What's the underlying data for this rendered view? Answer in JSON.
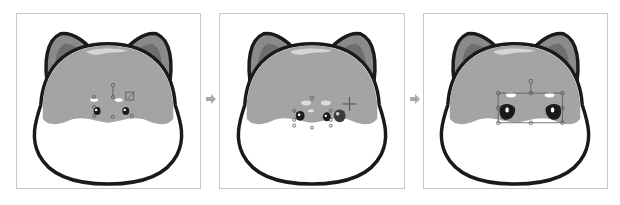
{
  "figure": {
    "colors": {
      "outline": "#1a1a1a",
      "fur": "#a4a4a4",
      "fur_highlight": "#d6d6d6",
      "ear_outer": "#8a8a8a",
      "ear_inner": "#6e6e6e",
      "face_white": "#ffffff",
      "handle": "#555555",
      "arrow": "#a9a9a9",
      "panel_border": "#c8c8c8"
    },
    "panels": [
      {
        "step": 1,
        "label": "step-1-small-eyes-selected",
        "state": "eyes and brows selected with bounding handles; rotate handle above; small eyes"
      },
      {
        "step": 2,
        "label": "step-2-eye-duplicated-moved",
        "state": "second eye copy dragged with move cursor (crosshair)"
      },
      {
        "step": 3,
        "label": "step-3-eyes-scaled-up",
        "state": "eyes group scaled larger with bounding box handles"
      }
    ],
    "arrows": [
      {
        "from": 1,
        "to": 2,
        "icon": "arrow-right-icon"
      },
      {
        "from": 2,
        "to": 3,
        "icon": "arrow-right-icon"
      }
    ]
  }
}
